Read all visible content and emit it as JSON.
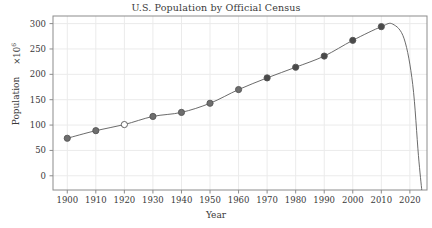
{
  "chart_data": {
    "type": "line",
    "title": "U.S. Population by Official Census",
    "xlabel": "Year",
    "ylabel": "Population",
    "y_multiplier": "×10",
    "y_multiplier_exponent": "6",
    "x": [
      1900,
      1910,
      1920,
      1930,
      1940,
      1950,
      1960,
      1970,
      1980,
      1990,
      2000,
      2010
    ],
    "values": [
      76,
      92,
      106,
      123,
      132,
      151,
      179,
      203,
      227,
      249,
      281,
      309
    ],
    "plotted_values": [
      74,
      89,
      101,
      117,
      125,
      143,
      170,
      193,
      214,
      236,
      267,
      294
    ],
    "categories": [
      "1900",
      "1910",
      "1920",
      "1930",
      "1940",
      "1950",
      "1960",
      "1970",
      "1980",
      "1990",
      "2000",
      "2010"
    ],
    "xlim": [
      1895,
      2026
    ],
    "ylim": [
      -28,
      315
    ],
    "xticks": [
      "1900",
      "1910",
      "1920",
      "1930",
      "1940",
      "1950",
      "1960",
      "1970",
      "1980",
      "1990",
      "2000",
      "2010",
      "2020"
    ],
    "xtick_values": [
      1900,
      1910,
      1920,
      1930,
      1940,
      1950,
      1960,
      1970,
      1980,
      1990,
      2000,
      2010,
      2020
    ],
    "yticks": [
      "0",
      "50",
      "100",
      "150",
      "200",
      "250",
      "300"
    ],
    "ytick_values": [
      0,
      50,
      100,
      150,
      200,
      250,
      300
    ],
    "grid": true,
    "legend": "none",
    "marker_open_index": 2,
    "line_color": "#5a5a5a",
    "marker_fill": "#6e6e6e",
    "marker_fill_dark": "#4a4a4a",
    "marker_open_fill": "#ffffff",
    "marker_edge": "#555555",
    "grid_color": "#ebebeb",
    "frame_color": "#8c8c8c",
    "background": "#ffffff",
    "extrapolation_note": "spline curve overshoots after 2010 and plunges steeply below axis near 2024"
  }
}
